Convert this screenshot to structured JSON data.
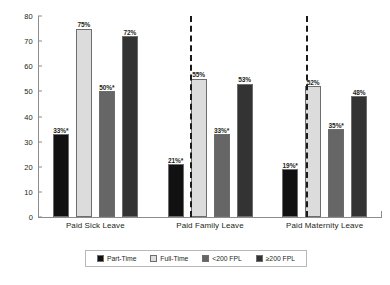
{
  "chart_data": {
    "type": "bar",
    "title": "",
    "xlabel": "",
    "ylabel": "",
    "ylim": [
      0,
      80
    ],
    "yticks": [
      "0",
      "10",
      "20",
      "30",
      "40",
      "50",
      "60",
      "70",
      "80"
    ],
    "grid": false,
    "legend_position": "bottom",
    "categories": [
      "Paid Sick Leave",
      "Paid Family Leave",
      "Paid Maternity Leave"
    ],
    "series": [
      {
        "name": "Part-Time",
        "color": "#111111",
        "values": [
          33,
          21,
          19
        ],
        "labels": [
          "33%*",
          "21%*",
          "19%*"
        ]
      },
      {
        "name": "Full-Time",
        "color": "#dcdcdc",
        "values": [
          75,
          55,
          52
        ],
        "labels": [
          "75%",
          "55%",
          "52%"
        ]
      },
      {
        "name": "<200 FPL",
        "color": "#666666",
        "values": [
          50,
          33,
          35
        ],
        "labels": [
          "50%*",
          "33%*",
          "35%*"
        ]
      },
      {
        "name": "≥200 FPL",
        "color": "#333333",
        "values": [
          72,
          53,
          48
        ],
        "labels": [
          "72%",
          "53%",
          "48%"
        ]
      }
    ],
    "annotations": [
      "* denotes statistically significant difference"
    ]
  },
  "axis": {
    "y_ticks": [
      {
        "label": "80",
        "value": 80
      },
      {
        "label": "70",
        "value": 70
      },
      {
        "label": "60",
        "value": 60
      },
      {
        "label": "50",
        "value": 50
      },
      {
        "label": "40",
        "value": 40
      },
      {
        "label": "30",
        "value": 30
      },
      {
        "label": "20",
        "value": 20
      },
      {
        "label": "10",
        "value": 10
      },
      {
        "label": "0",
        "value": 0
      }
    ]
  },
  "groups": [
    {
      "caption": "Paid Sick Leave",
      "bars": [
        {
          "series": "Part-Time",
          "label": "33%*",
          "value": 33,
          "color": "#111111"
        },
        {
          "series": "Full-Time",
          "label": "75%",
          "value": 75,
          "color": "#dcdcdc"
        },
        {
          "series": "<200 FPL",
          "label": "50%*",
          "value": 50,
          "color": "#666666"
        },
        {
          "series": "≥200 FPL",
          "label": "72%",
          "value": 72,
          "color": "#333333"
        }
      ]
    },
    {
      "caption": "Paid Family Leave",
      "bars": [
        {
          "series": "Part-Time",
          "label": "21%*",
          "value": 21,
          "color": "#111111"
        },
        {
          "series": "Full-Time",
          "label": "55%",
          "value": 55,
          "color": "#dcdcdc"
        },
        {
          "series": "<200 FPL",
          "label": "33%*",
          "value": 33,
          "color": "#666666"
        },
        {
          "series": "≥200 FPL",
          "label": "53%",
          "value": 53,
          "color": "#333333"
        }
      ]
    },
    {
      "caption": "Paid Maternity Leave",
      "bars": [
        {
          "series": "Part-Time",
          "label": "19%*",
          "value": 19,
          "color": "#111111"
        },
        {
          "series": "Full-Time",
          "label": "52%",
          "value": 52,
          "color": "#dcdcdc"
        },
        {
          "series": "<200 FPL",
          "label": "35%*",
          "value": 35,
          "color": "#666666"
        },
        {
          "series": "≥200 FPL",
          "label": "48%",
          "value": 48,
          "color": "#333333"
        }
      ]
    }
  ],
  "legend": {
    "items": [
      {
        "label": "Part-Time",
        "color": "#111111"
      },
      {
        "label": "Full-Time",
        "color": "#dcdcdc"
      },
      {
        "label": "<200 FPL",
        "color": "#666666"
      },
      {
        "label": "≥200 FPL",
        "color": "#333333"
      }
    ]
  }
}
